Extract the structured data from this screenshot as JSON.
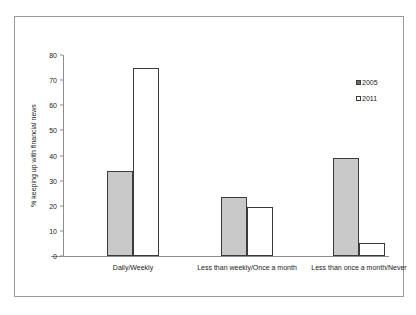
{
  "chart_data": {
    "type": "bar",
    "title": "",
    "xlabel": "",
    "ylabel": "% keeping up with financial news",
    "ylim": [
      0,
      80
    ],
    "ytick_step": 10,
    "yticks": [
      "80",
      "70",
      "60",
      "50",
      "40",
      "30",
      "20",
      "10",
      "0"
    ],
    "grid": false,
    "legend_position": "right",
    "categories": [
      "Daily/Weekly",
      "Less than weekly/Once a month",
      "Less than once a month/Never"
    ],
    "series": [
      {
        "name": "2005",
        "color": "#c9c9c9",
        "values": [
          34,
          23.5,
          39
        ]
      },
      {
        "name": "2011",
        "color": "#ffffff",
        "values": [
          75,
          19.5,
          5
        ]
      }
    ]
  },
  "legend": {
    "items": [
      {
        "label": "2005"
      },
      {
        "label": "2011"
      }
    ]
  }
}
